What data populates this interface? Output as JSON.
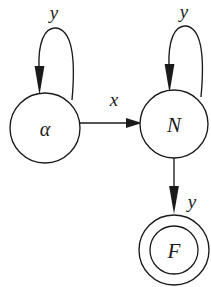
{
  "diagram": {
    "kind": "finite-state-automaton",
    "background_color": "#ffffff",
    "stroke_color": "#1a1a1a",
    "states": [
      {
        "id": "alpha",
        "label": "α",
        "accepting": false,
        "cx": 45,
        "cy": 128,
        "r": 35
      },
      {
        "id": "N",
        "label": "N",
        "accepting": false,
        "cx": 174,
        "cy": 124,
        "r": 34
      },
      {
        "id": "F",
        "label": "F",
        "accepting": true,
        "cx": 174,
        "cy": 250,
        "r": 35,
        "r_inner": 24
      }
    ],
    "transitions": [
      {
        "id": "alpha-self-loop",
        "from": "alpha",
        "to": "alpha",
        "label": "y",
        "label_x": 54,
        "label_y": 12,
        "kind": "self-loop"
      },
      {
        "id": "alpha-to-N",
        "from": "alpha",
        "to": "N",
        "label": "x",
        "label_x": 114,
        "label_y": 99,
        "kind": "straight"
      },
      {
        "id": "N-self-loop",
        "from": "N",
        "to": "N",
        "label": "y",
        "label_x": 184,
        "label_y": 11,
        "kind": "self-loop"
      },
      {
        "id": "N-to-F",
        "from": "N",
        "to": "F",
        "label": "y",
        "label_x": 192,
        "label_y": 201,
        "kind": "straight"
      }
    ]
  }
}
